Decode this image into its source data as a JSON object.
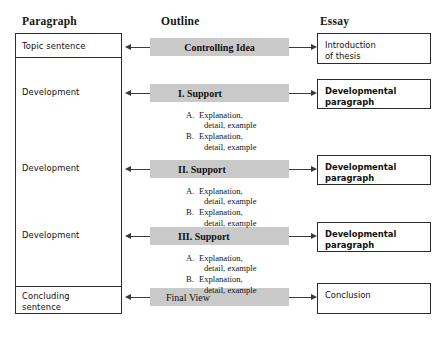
{
  "headers": {
    "paragraph": "Paragraph",
    "outline": "Outline",
    "essay": "Essay"
  },
  "colors": {
    "bar_fill": "#c9c9c9",
    "border": "#2b2b2b",
    "connector": "#3a3a3a",
    "background": "#ffffff"
  },
  "paragraph_column": {
    "items": [
      {
        "label": "Topic sentence"
      },
      {
        "label": "Development"
      },
      {
        "label": "Development"
      },
      {
        "label": "Development"
      },
      {
        "label": "Concluding\nsentence"
      }
    ]
  },
  "outline_column": {
    "bars": [
      {
        "text": "Controlling Idea",
        "style": "centered"
      },
      {
        "text": "I.  Support",
        "style": "indent"
      },
      {
        "text": "II.  Support",
        "style": "indent"
      },
      {
        "text": "III.  Support",
        "style": "indent"
      },
      {
        "text": "Final View",
        "style": "left"
      }
    ],
    "sublists": [
      {
        "items": [
          {
            "marker": "A.",
            "line1": "Explanation,",
            "line2": "detail, example"
          },
          {
            "marker": "B.",
            "line1": "Explanation,",
            "line2": "detail, example"
          }
        ]
      },
      {
        "items": [
          {
            "marker": "A.",
            "line1": "Explanation,",
            "line2": "detail, example"
          },
          {
            "marker": "B.",
            "line1": "Explanation,",
            "line2": "detail, example"
          }
        ]
      },
      {
        "items": [
          {
            "marker": "A.",
            "line1": "Explanation,",
            "line2": "detail, example"
          },
          {
            "marker": "B.",
            "line1": "Explanation,",
            "line2": "detail, example"
          }
        ]
      }
    ]
  },
  "essay_column": {
    "boxes": [
      {
        "text": "Introduction\nof thesis",
        "weight": "thin"
      },
      {
        "text": "Developmental\nparagraph",
        "weight": "bold"
      },
      {
        "text": "Developmental\nparagraph",
        "weight": "bold"
      },
      {
        "text": "Developmental\nparagraph",
        "weight": "bold"
      },
      {
        "text": "Conclusion",
        "weight": "thin"
      }
    ]
  },
  "connectors": {
    "left_arrow_icon": "arrow-left-icon",
    "right_arrow_icon": "arrow-right-icon",
    "rows": 5
  }
}
